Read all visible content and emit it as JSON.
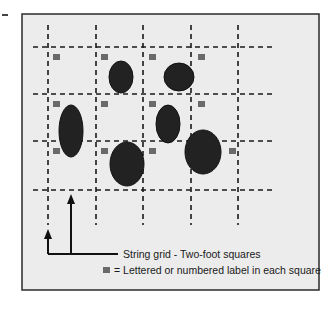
{
  "diagram": {
    "frame": {
      "x": 22,
      "y": 14,
      "width": 297,
      "height": 276,
      "fill": "#ececec",
      "stroke": "#2a2a2a"
    },
    "grid": {
      "vertical_lines_x": [
        48,
        96,
        143,
        191,
        238
      ],
      "horizontal_lines_y": [
        47,
        94,
        141,
        190
      ],
      "vertical_extent": {
        "y1": 25,
        "y2": 225
      },
      "horizontal_extent": {
        "x1": 33,
        "x2": 276
      },
      "stroke": "#1a1a1a",
      "dash": "5,4",
      "square_size_label": "Two-foot squares"
    },
    "labels": {
      "color": "#6a6a6a",
      "size": [
        7,
        6
      ],
      "positions": [
        [
          53,
          54
        ],
        [
          101,
          54
        ],
        [
          149,
          54
        ],
        [
          198,
          54
        ],
        [
          53,
          101
        ],
        [
          101,
          101
        ],
        [
          149,
          101
        ],
        [
          198,
          101
        ],
        [
          53,
          148
        ],
        [
          101,
          148
        ],
        [
          149,
          148
        ],
        [
          229,
          148
        ]
      ]
    },
    "objects": {
      "color": "#222222",
      "ellipses": [
        {
          "cx": 121,
          "cy": 77,
          "rx": 12,
          "ry": 16
        },
        {
          "cx": 179,
          "cy": 77,
          "rx": 15,
          "ry": 14
        },
        {
          "cx": 71,
          "cy": 131,
          "rx": 12,
          "ry": 26
        },
        {
          "cx": 168,
          "cy": 124,
          "rx": 12,
          "ry": 19
        },
        {
          "cx": 127,
          "cy": 164,
          "rx": 17,
          "ry": 22
        },
        {
          "cx": 203,
          "cy": 152,
          "rx": 18,
          "ry": 22
        }
      ]
    },
    "arrows": {
      "color": "#111111",
      "pointers": [
        {
          "x": 48,
          "y_top": 229
        },
        {
          "x": 71,
          "y_top": 194
        }
      ],
      "base_y": 254,
      "leader_end_x": 118
    },
    "legend": {
      "string_grid_text": "String grid - Two-foot squares",
      "label_key_text": "= Lettered or numbered label in each square",
      "label_key_symbol": "gray-square"
    }
  }
}
